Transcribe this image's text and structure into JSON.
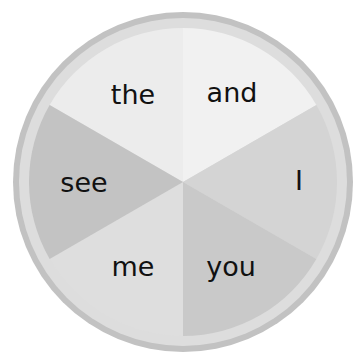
{
  "spinner": {
    "center": {
      "x": 183,
      "y": 182
    },
    "outer_radius": 170,
    "ring_outer_color": "#c2c2c2",
    "ring_inner_radius": 164,
    "ring_inner_color": "#dddddd",
    "wedge_radius": 154,
    "segments": [
      {
        "label": "the",
        "start_deg": 210,
        "end_deg": 270,
        "color": "#ececec",
        "text_x": 133,
        "text_y": 104
      },
      {
        "label": "and",
        "start_deg": 270,
        "end_deg": 330,
        "color": "#f1f1f1",
        "text_x": 232,
        "text_y": 102
      },
      {
        "label": "I",
        "start_deg": 330,
        "end_deg": 390,
        "color": "#d4d4d4",
        "text_x": 299,
        "text_y": 190
      },
      {
        "label": "you",
        "start_deg": 30,
        "end_deg": 90,
        "color": "#c9c9c9",
        "text_x": 231,
        "text_y": 276
      },
      {
        "label": "me",
        "start_deg": 90,
        "end_deg": 150,
        "color": "#dedede",
        "text_x": 133,
        "text_y": 276
      },
      {
        "label": "see",
        "start_deg": 150,
        "end_deg": 210,
        "color": "#c3c3c3",
        "text_x": 84,
        "text_y": 192
      }
    ]
  }
}
